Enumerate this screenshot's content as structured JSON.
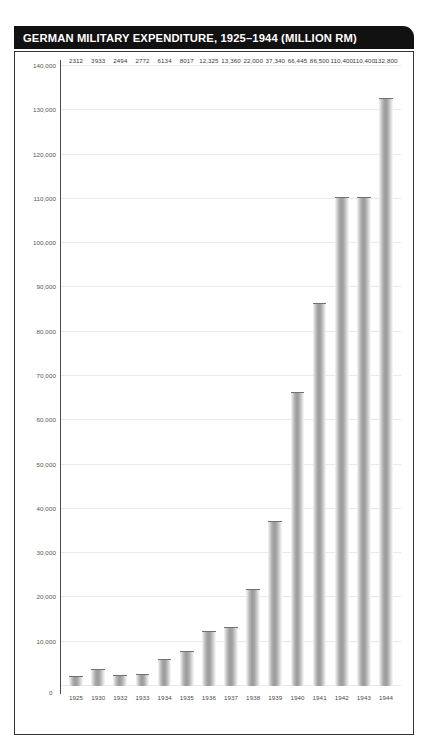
{
  "title": "GERMAN MILITARY EXPENDITURE, 1925–1944 (MILLION RM)",
  "chart_data": {
    "type": "bar",
    "title": "GERMAN MILITARY EXPENDITURE, 1925–1944 (MILLION RM)",
    "xlabel": "",
    "ylabel": "",
    "ylim": [
      0,
      140000
    ],
    "grid": true,
    "legend": "none",
    "categories": [
      "1925",
      "1930",
      "1932",
      "1933",
      "1934",
      "1935",
      "1936",
      "1937",
      "1938",
      "1939",
      "1940",
      "1941",
      "1942",
      "1943",
      "1944"
    ],
    "values": [
      2312,
      3933,
      2494,
      2772,
      6134,
      8017,
      12325,
      13360,
      22000,
      37340,
      66445,
      86500,
      110400,
      110400,
      132800
    ],
    "value_labels": [
      "2312",
      "3933",
      "2494",
      "2772",
      "6134",
      "8017",
      "12,325",
      "13,360",
      "22,000",
      "37,340",
      "66,445",
      "86,500",
      "110,400",
      "110,400",
      "132,800"
    ],
    "ytick_values": [
      0,
      10000,
      20000,
      30000,
      40000,
      50000,
      60000,
      70000,
      80000,
      90000,
      100000,
      110000,
      120000,
      130000,
      140000
    ],
    "ytick_labels": [
      "0",
      "10,000",
      "20,000",
      "30,000",
      "40,000",
      "50,000",
      "60,000",
      "70,000",
      "80,000",
      "90,000",
      "100,000",
      "110,000",
      "120,000",
      "130,000",
      "140,000"
    ]
  },
  "colors": {
    "title_bar": "#111111",
    "title_text": "#ffffff",
    "frame_border": "#333333",
    "gridline": "#e9e9e9",
    "axis": "#4a4a4a",
    "bar_mid": "#9a9a9a",
    "background": "#ffffff"
  }
}
